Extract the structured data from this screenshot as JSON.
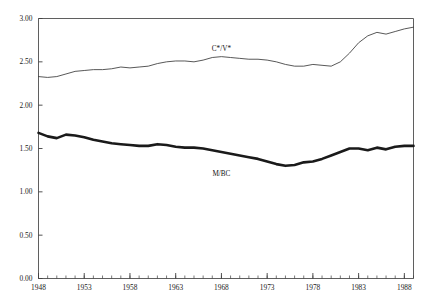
{
  "chart_data": {
    "type": "line",
    "title": "",
    "subtitle": "",
    "xlabel": "",
    "ylabel": "",
    "xlim": [
      1948,
      1989
    ],
    "ylim": [
      0.0,
      3.0
    ],
    "grid": false,
    "legend_position": "inline-annotation",
    "y_ticks": [
      "0.00",
      "0.50",
      "1.00",
      "1.50",
      "2.00",
      "2.50",
      "3.00"
    ],
    "y_tick_values": [
      0.0,
      0.5,
      1.0,
      1.5,
      2.0,
      2.5,
      3.0
    ],
    "x_ticks": [
      "1948",
      "1953",
      "1958",
      "1963",
      "1968",
      "1973",
      "1978",
      "1983",
      "1988"
    ],
    "x_tick_values": [
      1948,
      1953,
      1958,
      1963,
      1968,
      1973,
      1978,
      1983,
      1988
    ],
    "x_minor_step": 1,
    "x": [
      1948,
      1949,
      1950,
      1951,
      1952,
      1953,
      1954,
      1955,
      1956,
      1957,
      1958,
      1959,
      1960,
      1961,
      1962,
      1963,
      1964,
      1965,
      1966,
      1967,
      1968,
      1969,
      1970,
      1971,
      1972,
      1973,
      1974,
      1975,
      1976,
      1977,
      1978,
      1979,
      1980,
      1981,
      1982,
      1983,
      1984,
      1985,
      1986,
      1987,
      1988,
      1989
    ],
    "series": [
      {
        "name": "C*/V*",
        "style": "thin",
        "color": "#3a3a3a",
        "label_x": 1968,
        "label_y": 2.63,
        "values": [
          2.33,
          2.32,
          2.33,
          2.36,
          2.39,
          2.4,
          2.41,
          2.41,
          2.42,
          2.44,
          2.43,
          2.44,
          2.45,
          2.48,
          2.5,
          2.51,
          2.51,
          2.5,
          2.52,
          2.55,
          2.56,
          2.55,
          2.54,
          2.53,
          2.53,
          2.52,
          2.5,
          2.47,
          2.45,
          2.45,
          2.47,
          2.46,
          2.45,
          2.5,
          2.6,
          2.72,
          2.8,
          2.84,
          2.82,
          2.85,
          2.88,
          2.9
        ]
      },
      {
        "name": "M/BC",
        "style": "thick",
        "color": "#1a1a1a",
        "label_x": 1968,
        "label_y": 1.18,
        "values": [
          1.68,
          1.64,
          1.62,
          1.66,
          1.65,
          1.63,
          1.6,
          1.58,
          1.56,
          1.55,
          1.54,
          1.53,
          1.53,
          1.55,
          1.54,
          1.52,
          1.51,
          1.51,
          1.5,
          1.48,
          1.46,
          1.44,
          1.42,
          1.4,
          1.38,
          1.35,
          1.32,
          1.3,
          1.31,
          1.34,
          1.35,
          1.38,
          1.42,
          1.46,
          1.5,
          1.5,
          1.48,
          1.51,
          1.49,
          1.52,
          1.53,
          1.53
        ]
      }
    ]
  }
}
